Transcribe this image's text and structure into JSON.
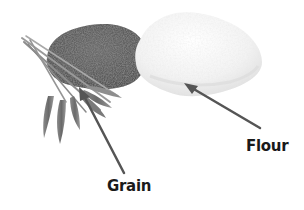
{
  "diagram": {
    "background": "#ffffff",
    "items": [
      {
        "name": "grain",
        "label": "Grain",
        "description": "pile of wheat grain with wheat stalks"
      },
      {
        "name": "flour",
        "label": "Flour",
        "description": "pile of white flour"
      }
    ],
    "arrow_color": "#555555",
    "label_color": "#1a1a1a"
  }
}
